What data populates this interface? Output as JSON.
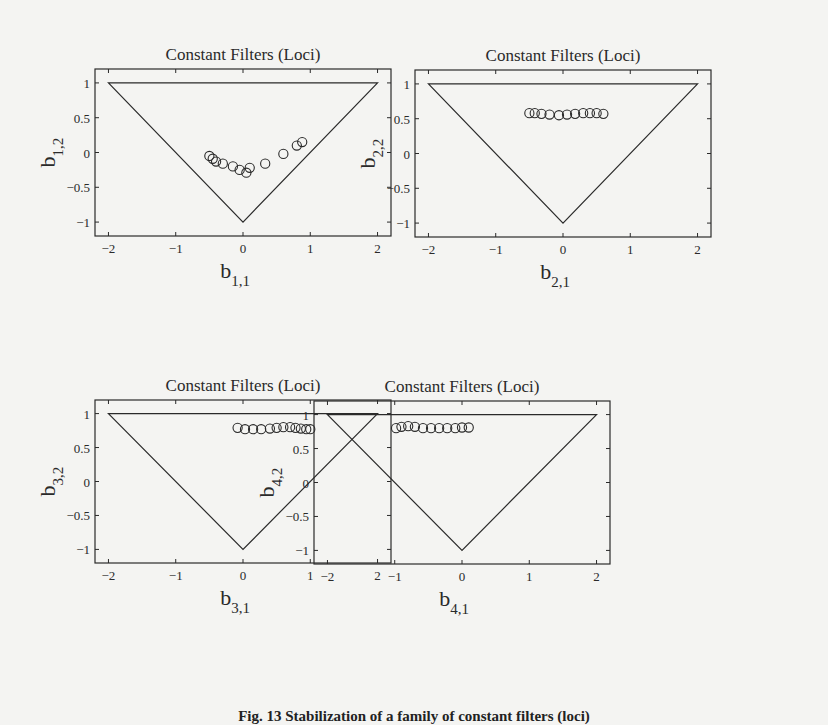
{
  "figure": {
    "caption": "Fig. 13  Stabilization of a family of constant filters (loci)"
  },
  "chart_data": [
    {
      "type": "scatter",
      "title": "Constant Filters (Loci)",
      "xlabel": "b",
      "xsub": "1,1",
      "ylabel": "b",
      "ysub": "1,2",
      "xlim": [
        -2.2,
        2.2
      ],
      "ylim": [
        -1.2,
        1.2
      ],
      "xticks": [
        -2,
        -1,
        0,
        1,
        2
      ],
      "yticks": [
        -1,
        -0.5,
        0,
        0.5,
        1
      ],
      "ytick_labels": [
        "−1",
        "−0.5",
        "0",
        "0.5",
        "1"
      ],
      "xtick_labels": [
        "−2",
        "−1",
        "0",
        "1",
        "2"
      ],
      "triangle": [
        [
          -2,
          1
        ],
        [
          2,
          1
        ],
        [
          0,
          -1
        ]
      ],
      "points": [
        [
          -0.5,
          -0.05
        ],
        [
          -0.45,
          -0.09
        ],
        [
          -0.4,
          -0.13
        ],
        [
          -0.3,
          -0.16
        ],
        [
          -0.15,
          -0.2
        ],
        [
          -0.05,
          -0.25
        ],
        [
          0.05,
          -0.29
        ],
        [
          0.1,
          -0.22
        ],
        [
          0.33,
          -0.16
        ],
        [
          0.6,
          -0.02
        ],
        [
          0.8,
          0.1
        ],
        [
          0.88,
          0.15
        ]
      ]
    },
    {
      "type": "scatter",
      "title": "Constant Filters (Loci)",
      "xlabel": "b",
      "xsub": "2,1",
      "ylabel": "b",
      "ysub": "2,2",
      "xlim": [
        -2.2,
        2.2
      ],
      "ylim": [
        -1.2,
        1.2
      ],
      "xticks": [
        -2,
        -1,
        0,
        1,
        2
      ],
      "yticks": [
        -1,
        -0.5,
        0,
        0.5,
        1
      ],
      "ytick_labels": [
        "−1",
        "−0.5",
        "0",
        "0.5",
        "1"
      ],
      "xtick_labels": [
        "−2",
        "−1",
        "0",
        "1",
        "2"
      ],
      "triangle": [
        [
          -2,
          1
        ],
        [
          2,
          1
        ],
        [
          0,
          -1
        ]
      ],
      "points": [
        [
          -0.5,
          0.58
        ],
        [
          -0.42,
          0.58
        ],
        [
          -0.32,
          0.57
        ],
        [
          -0.2,
          0.56
        ],
        [
          -0.06,
          0.55
        ],
        [
          0.06,
          0.56
        ],
        [
          0.18,
          0.57
        ],
        [
          0.3,
          0.58
        ],
        [
          0.4,
          0.58
        ],
        [
          0.5,
          0.58
        ],
        [
          0.6,
          0.57
        ]
      ]
    },
    {
      "type": "scatter",
      "title": "Constant Filters (Loci)",
      "xlabel": "b",
      "xsub": "3,1",
      "ylabel": "b",
      "ysub": "3,2",
      "xlim": [
        -2.2,
        2.2
      ],
      "ylim": [
        -1.2,
        1.2
      ],
      "xticks": [
        -2,
        -1,
        0,
        1,
        2
      ],
      "yticks": [
        -1,
        -0.5,
        0,
        0.5,
        1
      ],
      "ytick_labels": [
        "−1",
        "−0.5",
        "0",
        "0.5",
        "1"
      ],
      "xtick_labels": [
        "−2",
        "−1",
        "0",
        "1",
        "2"
      ],
      "triangle": [
        [
          -2,
          1
        ],
        [
          2,
          1
        ],
        [
          0,
          -1
        ]
      ],
      "points": [
        [
          -0.08,
          0.79
        ],
        [
          0.03,
          0.77
        ],
        [
          0.15,
          0.77
        ],
        [
          0.27,
          0.77
        ],
        [
          0.4,
          0.78
        ],
        [
          0.5,
          0.79
        ],
        [
          0.6,
          0.8
        ],
        [
          0.7,
          0.8
        ],
        [
          0.78,
          0.79
        ],
        [
          0.86,
          0.78
        ],
        [
          0.94,
          0.77
        ],
        [
          1.0,
          0.77
        ]
      ]
    },
    {
      "type": "scatter",
      "title": "Constant Filters (Loci)",
      "xlabel": "b",
      "xsub": "4,1",
      "ylabel": "b",
      "ysub": "4,2",
      "xlim": [
        -2.2,
        2.2
      ],
      "ylim": [
        -1.2,
        1.2
      ],
      "xticks": [
        -2,
        -1,
        0,
        1,
        2
      ],
      "yticks": [
        -1,
        -0.5,
        0,
        0.5,
        1
      ],
      "ytick_labels": [
        "−1",
        "−0.5",
        "0",
        "0.5",
        "1"
      ],
      "xtick_labels": [
        "−2",
        "−1",
        "0",
        "1",
        "2"
      ],
      "triangle": [
        [
          -2,
          1
        ],
        [
          2,
          1
        ],
        [
          0,
          -1
        ]
      ],
      "points": [
        [
          -0.98,
          0.8
        ],
        [
          -0.9,
          0.82
        ],
        [
          -0.8,
          0.83
        ],
        [
          -0.7,
          0.82
        ],
        [
          -0.58,
          0.8
        ],
        [
          -0.46,
          0.8
        ],
        [
          -0.34,
          0.8
        ],
        [
          -0.22,
          0.8
        ],
        [
          -0.1,
          0.8
        ],
        [
          0.0,
          0.81
        ],
        [
          0.1,
          0.81
        ]
      ]
    }
  ]
}
